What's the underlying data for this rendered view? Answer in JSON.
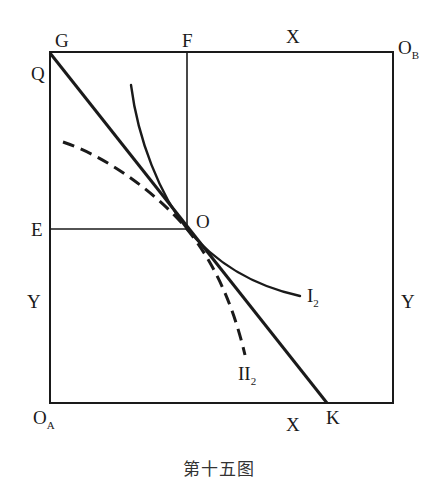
{
  "figure": {
    "caption": "第十五图",
    "type": "Edgeworth box diagram",
    "labels": {
      "G": "G",
      "F": "F",
      "X_top": "X",
      "O_B_main": "O",
      "O_B_sub": "B",
      "Q": "Q",
      "E": "E",
      "O": "O",
      "Y_left": "Y",
      "Y_right": "Y",
      "I2_main": "I",
      "I2_sub": "2",
      "II2_main": "II",
      "II2_sub": "2",
      "O_A_main": "O",
      "O_A_sub": "A",
      "X_bottom": "X",
      "K": "K"
    },
    "elements": {
      "box": "rectangle with corners O_A (bottom-left) and O_B (top-right)",
      "price_line": "straight line QK through point O",
      "curve_I2": "solid indifference curve I2 tangent at O",
      "curve_II2": "dashed indifference curve II2 tangent at O",
      "guide_F": "vertical line from F down to O",
      "guide_E": "horizontal line from E right to O"
    },
    "colors": {
      "ink": "#1a1a1a",
      "background": "#ffffff"
    }
  }
}
